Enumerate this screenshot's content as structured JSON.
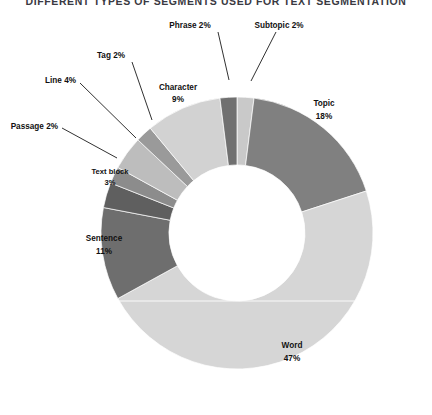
{
  "chart_title": "DIFFERENT TYPES OF SEGMENTS USED FOR TEXT SEGMENTATION",
  "labels": {
    "word": "Word",
    "word_pct": "47%",
    "topic": "Topic",
    "topic_pct": "18%",
    "sentence": "Sentence",
    "sentence_pct": "11%",
    "character": "Character",
    "character_pct": "9%",
    "line": "Line  4%",
    "text_block": "Text block",
    "text_block_pct": "3%",
    "passage": "Passage 2%",
    "tag": "Tag 2%",
    "phrase": "Phrase 2%",
    "subtopic": "Subtopic 2%"
  },
  "chart_data": {
    "type": "pie",
    "variant": "donut",
    "title": "DIFFERENT TYPES OF SEGMENTS USED FOR TEXT SEGMENTATION",
    "xlabel": "",
    "ylabel": "",
    "legend": "none",
    "grid": false,
    "units": "percent",
    "total": 100,
    "start_angle_deg": 0,
    "direction": "clockwise",
    "inner_radius_ratio": 0.5,
    "categories": [
      "Subtopic",
      "Topic",
      "Word",
      "Sentence",
      "Text block",
      "Passage",
      "Line",
      "Tag",
      "Character",
      "Phrase"
    ],
    "values": [
      2,
      18,
      47,
      11,
      3,
      2,
      4,
      2,
      9,
      2
    ],
    "colors": [
      "#c9c9c9",
      "#808080",
      "#d6d6d6",
      "#6e6e6e",
      "#5f5f5f",
      "#8c8c8c",
      "#bdbdbd",
      "#9a9a9a",
      "#d2d2d2",
      "#707070"
    ],
    "slices": [
      {
        "name": "Subtopic",
        "value": 2,
        "label": "Subtopic 2%",
        "color": "#c9c9c9",
        "label_position": "outside"
      },
      {
        "name": "Topic",
        "value": 18,
        "label": "Topic 18%",
        "color": "#808080",
        "label_position": "inside"
      },
      {
        "name": "Word",
        "value": 47,
        "label": "Word 47%",
        "color": "#d6d6d6",
        "label_position": "inside"
      },
      {
        "name": "Sentence",
        "value": 11,
        "label": "Sentence 11%",
        "color": "#6e6e6e",
        "label_position": "inside"
      },
      {
        "name": "Text block",
        "value": 3,
        "label": "Text block 3%",
        "color": "#5f5f5f",
        "label_position": "inside"
      },
      {
        "name": "Passage",
        "value": 2,
        "label": "Passage 2%",
        "color": "#8c8c8c",
        "label_position": "outside"
      },
      {
        "name": "Line",
        "value": 4,
        "label": "Line 4%",
        "color": "#bdbdbd",
        "label_position": "outside"
      },
      {
        "name": "Tag",
        "value": 2,
        "label": "Tag 2%",
        "color": "#9a9a9a",
        "label_position": "outside"
      },
      {
        "name": "Character",
        "value": 9,
        "label": "Character 9%",
        "color": "#d2d2d2",
        "label_position": "inside"
      },
      {
        "name": "Phrase",
        "value": 2,
        "label": "Phrase 2%",
        "color": "#707070",
        "label_position": "outside"
      }
    ]
  }
}
